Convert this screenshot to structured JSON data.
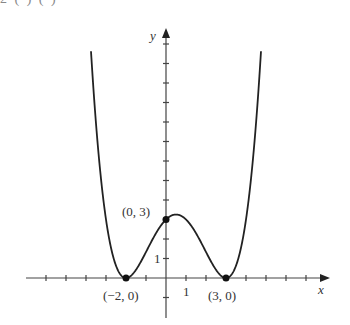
{
  "header_fragment": "2 (         ) (         )",
  "chart_data": {
    "type": "line",
    "title": "",
    "xlabel": "x",
    "ylabel": "y",
    "function": "y = (x+2)^2 (x-3)^2 / 12",
    "xlim": [
      -7,
      8
    ],
    "ylim": [
      -2,
      12
    ],
    "grid": false,
    "tick_labels": {
      "x": [
        "1"
      ],
      "y": [
        "1"
      ]
    },
    "points": [
      {
        "x": -2,
        "y": 0,
        "label": "(−2, 0)"
      },
      {
        "x": 0,
        "y": 3,
        "label": "(0, 3)"
      },
      {
        "x": 3,
        "y": 0,
        "label": "(3, 0)"
      }
    ],
    "local_max": {
      "x": 0.5,
      "y": 3.26
    }
  },
  "labels": {
    "x_axis": "x",
    "y_axis": "y",
    "x_tick_one": "1",
    "y_tick_one": "1",
    "pt_left": "(−2, 0)",
    "pt_mid": "(0, 3)",
    "pt_right": "(3, 0)"
  }
}
